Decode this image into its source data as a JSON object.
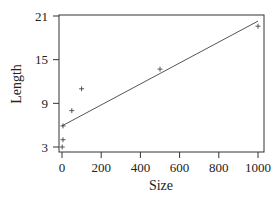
{
  "chart_data": {
    "type": "scatter",
    "title": "",
    "xlabel": "Size",
    "ylabel": "Length",
    "xlim": [
      0,
      1000
    ],
    "ylim": [
      3,
      21
    ],
    "x_ticks": [
      0,
      200,
      400,
      600,
      800,
      1000
    ],
    "y_ticks": [
      3,
      9,
      15,
      21
    ],
    "grid": false,
    "legend": null,
    "series": [
      {
        "name": "observations",
        "marker": "+",
        "points": [
          {
            "x": 1,
            "y": 3
          },
          {
            "x": 5,
            "y": 4
          },
          {
            "x": 5,
            "y": 5.9
          },
          {
            "x": 50,
            "y": 8
          },
          {
            "x": 100,
            "y": 11
          },
          {
            "x": 500,
            "y": 13.7
          },
          {
            "x": 1000,
            "y": 19.6
          }
        ]
      },
      {
        "name": "fitted line",
        "type": "line",
        "points": [
          {
            "x": 0,
            "y": 5.9
          },
          {
            "x": 1000,
            "y": 20.3
          }
        ]
      }
    ]
  },
  "labels": {
    "x_ticks": [
      "0",
      "200",
      "400",
      "600",
      "800",
      "1000"
    ],
    "y_ticks": [
      "3",
      "9",
      "15",
      "21"
    ],
    "xlabel": "Size",
    "ylabel": "Length"
  }
}
